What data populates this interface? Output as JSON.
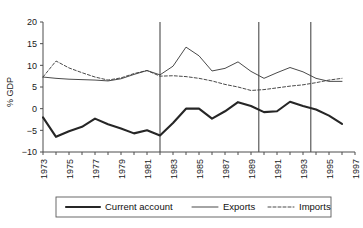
{
  "chart_data": {
    "type": "line",
    "title": "",
    "subtitle": "",
    "xlabel": "",
    "ylabel": "% GDP",
    "xlim": [
      1973,
      1997
    ],
    "ylim": [
      -10,
      20
    ],
    "yticks": [
      -10,
      -5,
      0,
      5,
      10,
      15,
      20
    ],
    "ytick_labels": [
      "−10",
      "−5",
      "0",
      "5",
      "10",
      "15",
      "20"
    ],
    "xticks": [
      1973,
      1974,
      1975,
      1976,
      1977,
      1978,
      1979,
      1980,
      1981,
      1982,
      1983,
      1984,
      1985,
      1986,
      1987,
      1988,
      1989,
      1990,
      1991,
      1992,
      1993,
      1994,
      1995,
      1996,
      1997
    ],
    "xtick_labels_shown": [
      "1973",
      "1975",
      "1977",
      "1979",
      "1981",
      "1983",
      "1985",
      "1987",
      "1989",
      "1991",
      "1993",
      "1995",
      "1997"
    ],
    "grid": false,
    "legend_position": "bottom",
    "annotations": {
      "vertical_reference_lines": [
        1982,
        1989.6,
        1993.6
      ]
    },
    "x": [
      1973,
      1974,
      1975,
      1976,
      1977,
      1978,
      1979,
      1980,
      1981,
      1982,
      1983,
      1984,
      1985,
      1986,
      1987,
      1988,
      1989,
      1990,
      1991,
      1992,
      1993,
      1994,
      1995,
      1996
    ],
    "series": [
      {
        "name": "Current account",
        "style": "solid-thick",
        "color": "#262626",
        "values": [
          -2.0,
          -6.5,
          -5.2,
          -4.2,
          -2.3,
          -3.6,
          -4.6,
          -5.7,
          -5.0,
          -6.2,
          -3.3,
          0.0,
          0.0,
          -2.3,
          -0.6,
          1.5,
          0.6,
          -0.8,
          -0.6,
          1.6,
          0.6,
          -0.2,
          -1.6,
          -3.5
        ]
      },
      {
        "name": "Exports",
        "style": "solid-thin",
        "color": "#404040",
        "values": [
          7.3,
          7.0,
          6.8,
          6.7,
          6.6,
          6.4,
          6.9,
          7.9,
          8.8,
          7.8,
          9.8,
          14.2,
          12.2,
          8.7,
          9.3,
          10.8,
          8.6,
          7.0,
          8.3,
          9.5,
          8.5,
          7.0,
          6.3,
          6.3
        ]
      },
      {
        "name": "Imports",
        "style": "dashed",
        "color": "#404040",
        "values": [
          7.3,
          11.0,
          9.4,
          8.3,
          7.3,
          6.6,
          7.1,
          8.1,
          8.8,
          7.5,
          7.6,
          7.4,
          7.0,
          6.4,
          5.6,
          5.0,
          4.2,
          4.4,
          4.8,
          5.2,
          5.5,
          6.0,
          6.6,
          7.0
        ]
      }
    ]
  },
  "legend": {
    "items": [
      {
        "label": "Current account",
        "style": "solid-thick"
      },
      {
        "label": "Exports",
        "style": "solid-thin"
      },
      {
        "label": "Imports",
        "style": "dashed"
      }
    ]
  }
}
